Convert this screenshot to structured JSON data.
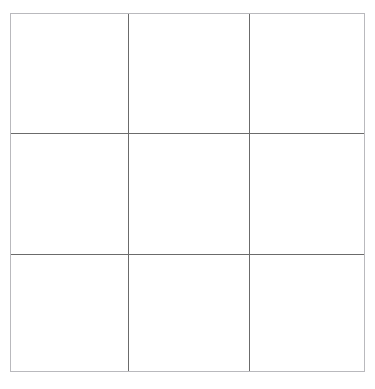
{
  "page": {
    "background_color": "#ffffff",
    "width": 375,
    "height": 389
  },
  "grid": {
    "name": "3x3 empty grid",
    "rows": 3,
    "columns": 3,
    "border_color": "#b9b9bd",
    "line_color": "#6b6b6b",
    "cell_background": "#ffffff",
    "origin_x": 10,
    "origin_y": 13,
    "width": 355,
    "height": 359,
    "vertical_line_x": [
      117,
      238
    ],
    "horizontal_line_y": [
      119,
      240
    ],
    "cells": [
      {
        "id": "r1c1",
        "row": 1,
        "col": 1,
        "label": ""
      },
      {
        "id": "r1c2",
        "row": 1,
        "col": 2,
        "label": ""
      },
      {
        "id": "r1c3",
        "row": 1,
        "col": 3,
        "label": ""
      },
      {
        "id": "r2c1",
        "row": 2,
        "col": 1,
        "label": ""
      },
      {
        "id": "r2c2",
        "row": 2,
        "col": 2,
        "label": ""
      },
      {
        "id": "r2c3",
        "row": 2,
        "col": 3,
        "label": ""
      },
      {
        "id": "r3c1",
        "row": 3,
        "col": 1,
        "label": ""
      },
      {
        "id": "r3c2",
        "row": 3,
        "col": 2,
        "label": ""
      },
      {
        "id": "r3c3",
        "row": 3,
        "col": 3,
        "label": ""
      }
    ]
  }
}
